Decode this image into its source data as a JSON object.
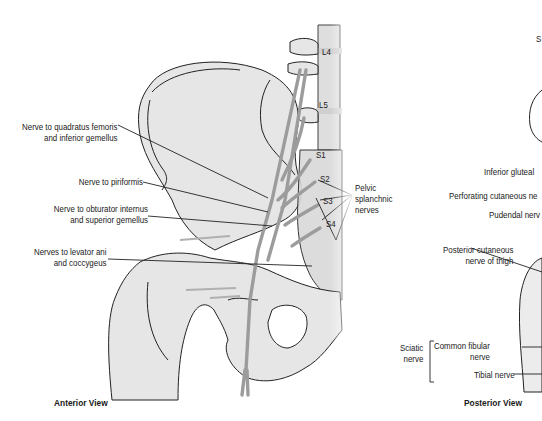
{
  "figure": {
    "anterior_view": {
      "title": "Anterior View",
      "labels": [
        {
          "line1": "Nerve to quadratus femoris",
          "line2": "and inferior gemellus"
        },
        {
          "line1": "Nerve to piriformis",
          "line2": ""
        },
        {
          "line1": "Nerve to obturator internus",
          "line2": "and superior gemellus"
        },
        {
          "line1": "Nerves to levator ani",
          "line2": "and coccygeus"
        }
      ],
      "vertebrae": [
        "L4",
        "L5",
        "S1",
        "S2",
        "S3",
        "S4"
      ],
      "pelvic_splanchnic": {
        "line1": "Pelvic",
        "line2": "splanchnic",
        "line3": "nerves"
      }
    },
    "posterior_view": {
      "title": "Posterior View",
      "top_label": "S",
      "labels": [
        "Inferior gluteal",
        "Perforating cutaneous ne",
        "Pudendal nerv"
      ],
      "posterior_cutaneous": {
        "line1": "Posterior cutaneous",
        "line2": "nerve of thigh"
      },
      "sciatic": {
        "group_line1": "Sciatic",
        "group_line2": "nerve",
        "branch1_line1": "Common fibular",
        "branch1_line2": "nerve",
        "branch2": "Tibial nerve"
      }
    }
  }
}
